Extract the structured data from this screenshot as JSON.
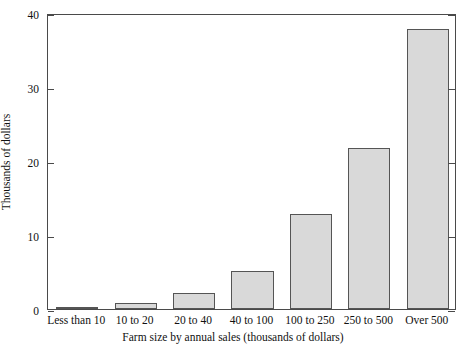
{
  "chart_data": {
    "type": "bar",
    "title": "",
    "xlabel": "Farm size by annual sales (thousands of dollars)",
    "ylabel": "Thousands of dollars",
    "categories": [
      "Less than 10",
      "10 to 20",
      "20 to 40",
      "40 to 100",
      "100 to 250",
      "250 to 500",
      "Over 500"
    ],
    "values": [
      0.1,
      0.8,
      2.1,
      5.2,
      12.8,
      21.8,
      37.8
    ],
    "ylim": [
      0,
      40
    ],
    "yticks": [
      0,
      10,
      20,
      30,
      40
    ],
    "ytick_labels": [
      "0",
      "10",
      "20",
      "30",
      "40"
    ],
    "grid": false,
    "legend": false,
    "bar_fill_color": "#d9d9d9",
    "bar_border_color": "#555555",
    "frame_color": "#4a4a4a",
    "background_color": "#ffffff"
  },
  "axis": {
    "y_tick_0": "0",
    "y_tick_1": "10",
    "y_tick_2": "20",
    "y_tick_3": "30",
    "y_tick_4": "40",
    "x_cat_0": "Less than 10",
    "x_cat_1": "10 to 20",
    "x_cat_2": "20 to 40",
    "x_cat_3": "40 to 100",
    "x_cat_4": "100 to 250",
    "x_cat_5": "250 to 500",
    "x_cat_6": "Over 500"
  },
  "titles": {
    "x_axis": "Farm size by annual sales (thousands of dollars)",
    "y_axis": "Thousands of dollars"
  }
}
